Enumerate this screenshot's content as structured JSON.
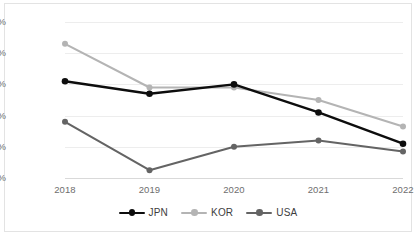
{
  "chart_data": {
    "type": "line",
    "title": "",
    "xlabel": "",
    "ylabel": "",
    "categories": [
      "2018",
      "2019",
      "2020",
      "2021",
      "2022"
    ],
    "ylim": [
      6.0,
      11.0
    ],
    "ytick_values": [
      11.0,
      10.0,
      9.0,
      8.0,
      7.0,
      6.0
    ],
    "ytick_labels": [
      "11.0%",
      "10.0%",
      "9.0%",
      "8.0%",
      "7.0%",
      "6.0%"
    ],
    "grid": true,
    "legend_position": "bottom",
    "series": [
      {
        "name": "JPN",
        "color": "#0d0d0d",
        "values": [
          9.1,
          8.7,
          9.0,
          8.1,
          7.1
        ]
      },
      {
        "name": "KOR",
        "color": "#b4b4b4",
        "values": [
          10.3,
          8.9,
          8.9,
          8.5,
          7.65
        ]
      },
      {
        "name": "USA",
        "color": "#646464",
        "values": [
          7.8,
          6.25,
          7.0,
          7.2,
          6.85
        ]
      }
    ]
  },
  "legend": {
    "items": [
      {
        "label": "JPN"
      },
      {
        "label": "KOR"
      },
      {
        "label": "USA"
      }
    ]
  },
  "colors": {
    "jpn": "#0d0d0d",
    "kor": "#b4b4b4",
    "usa": "#646464",
    "grid": "#ededed",
    "axis": "#d9d9d9",
    "tick_text": "#6e6e6e",
    "frame": "#e3e3e3",
    "background": "#ffffff"
  }
}
